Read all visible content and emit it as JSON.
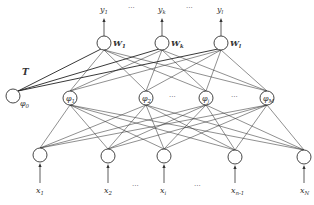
{
  "diagram": {
    "type": "rbf-neural-network",
    "output_layer": {
      "nodes": [
        {
          "id": "y1",
          "x": 104,
          "y": 43,
          "label": "y",
          "sub": "1",
          "weight": "W",
          "wsub": "1"
        },
        {
          "id": "yk",
          "x": 162,
          "y": 43,
          "label": "y",
          "sub": "k",
          "weight": "W",
          "wsub": "k"
        },
        {
          "id": "yl",
          "x": 221,
          "y": 43,
          "label": "y",
          "sub": "l",
          "weight": "W",
          "wsub": "l"
        }
      ],
      "ellipsis": [
        {
          "x": 133,
          "y": 10
        },
        {
          "x": 191,
          "y": 10
        }
      ]
    },
    "hidden_layer": {
      "bias": {
        "id": "phi0",
        "x": 13,
        "y": 96,
        "label": "φ",
        "sub": "0",
        "edge_label": "T"
      },
      "nodes": [
        {
          "id": "phi1",
          "x": 70,
          "y": 98,
          "label": "φ",
          "sub": "1"
        },
        {
          "id": "phi2",
          "x": 146,
          "y": 98,
          "label": "φ",
          "sub": "2"
        },
        {
          "id": "phij",
          "x": 206,
          "y": 98,
          "label": "φ",
          "sub": "j"
        },
        {
          "id": "phiM",
          "x": 267,
          "y": 98,
          "label": "φ",
          "sub": "M"
        }
      ],
      "ellipsis": [
        {
          "x": 174,
          "y": 99
        },
        {
          "x": 236,
          "y": 99
        }
      ]
    },
    "input_layer": {
      "nodes": [
        {
          "id": "x1",
          "x": 40,
          "y": 155,
          "label": "x",
          "sub": "1"
        },
        {
          "id": "x2",
          "x": 108,
          "y": 156,
          "label": "x",
          "sub": "2"
        },
        {
          "id": "xi",
          "x": 164,
          "y": 156,
          "label": "x",
          "sub": "i"
        },
        {
          "id": "xn1",
          "x": 235,
          "y": 157,
          "label": "x",
          "sub": "n-1"
        },
        {
          "id": "xN",
          "x": 304,
          "y": 157,
          "label": "x",
          "sub": "N"
        }
      ],
      "ellipsis": [
        {
          "x": 137,
          "y": 188
        },
        {
          "x": 199,
          "y": 188
        }
      ]
    },
    "colors": {
      "stroke": "#333333",
      "background": "#ffffff"
    }
  }
}
